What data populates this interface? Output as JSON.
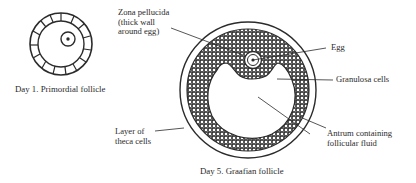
{
  "figure": {
    "primordial": {
      "caption": "Day 1. Primordial follicle"
    },
    "graafian": {
      "caption": "Day 5. Graafian follicle",
      "labels": {
        "zona_line1": "Zona pellucida",
        "zona_line2": "(thick wall",
        "zona_line3": "around egg)",
        "egg": "Egg",
        "granulosa": "Granulosa cells",
        "antrum_line1": "Antrum containing",
        "antrum_line2": "follicular fluid",
        "theca_line1": "Layer of",
        "theca_line2": "theca cells"
      }
    },
    "colors": {
      "ink": "#2b2b2b",
      "background": "#ffffff"
    }
  }
}
